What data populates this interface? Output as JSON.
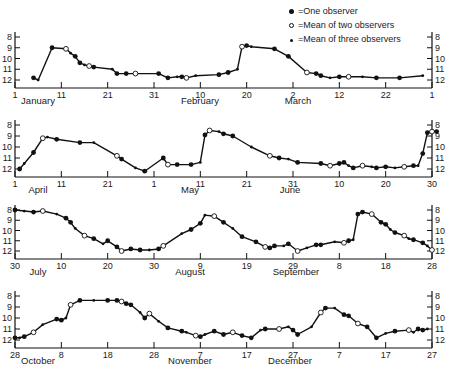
{
  "legend": {
    "one": "=One observer",
    "two": "=Mean of two observers",
    "three": "=Mean of three observers"
  },
  "chart_data": [
    {
      "type": "line",
      "title": "",
      "xlabel": "",
      "ylabel": "",
      "ylim": [
        12,
        8
      ],
      "yticks": [
        "8",
        "9",
        "10",
        "11",
        "12"
      ],
      "xticks": [
        "1",
        "11",
        "21",
        "31",
        "10",
        "20",
        "2",
        "12",
        "22",
        "1"
      ],
      "months": [
        "January",
        "February",
        "March"
      ],
      "x": [
        4,
        5,
        8,
        11,
        12,
        13,
        14,
        15,
        16,
        17,
        21,
        22,
        24,
        26,
        31,
        33,
        35,
        36,
        37,
        39,
        44,
        46,
        48,
        49,
        50,
        51,
        56,
        59,
        63,
        65,
        66,
        68,
        70,
        72,
        75,
        78,
        83,
        88
      ],
      "values": [
        11.8,
        12.0,
        9.0,
        9.1,
        9.5,
        9.8,
        10.4,
        10.6,
        10.7,
        10.8,
        11.0,
        11.4,
        11.4,
        11.4,
        11.4,
        11.8,
        11.7,
        11.7,
        11.8,
        11.6,
        11.5,
        11.3,
        11.0,
        8.9,
        8.8,
        8.9,
        9.1,
        9.8,
        11.3,
        11.4,
        11.6,
        11.8,
        11.7,
        11.7,
        11.7,
        11.8,
        11.8,
        11.6
      ]
    },
    {
      "type": "line",
      "ylim": [
        12,
        8
      ],
      "yticks": [
        "8",
        "9",
        "10",
        "11",
        "12"
      ],
      "xticks": [
        "1",
        "11",
        "21",
        "1",
        "11",
        "21",
        "31",
        "10",
        "20",
        "30"
      ],
      "months": [
        "April",
        "May",
        "June"
      ],
      "x": [
        1,
        2,
        4,
        6,
        7,
        9,
        14,
        17,
        22,
        23,
        26,
        28,
        32,
        33,
        35,
        38,
        40,
        41,
        42,
        44,
        45,
        47,
        51,
        55,
        57,
        59,
        61,
        66,
        68,
        70,
        71,
        72,
        73,
        75,
        77,
        78,
        80,
        82,
        84,
        86,
        87,
        88,
        89,
        90,
        91
      ],
      "values": [
        12.0,
        11.5,
        10.5,
        9.2,
        9.1,
        9.3,
        9.6,
        9.6,
        10.8,
        11.1,
        11.9,
        12.2,
        11.0,
        11.6,
        11.6,
        11.6,
        11.4,
        8.9,
        8.5,
        8.6,
        8.8,
        9.0,
        10.0,
        10.8,
        11.0,
        11.1,
        11.4,
        11.5,
        11.7,
        11.5,
        11.4,
        11.7,
        11.9,
        11.7,
        11.8,
        11.9,
        11.8,
        11.9,
        11.8,
        11.7,
        11.7,
        10.6,
        8.7,
        8.6,
        8.6
      ]
    },
    {
      "type": "line",
      "ylim": [
        12,
        8
      ],
      "yticks": [
        "8",
        "9",
        "10",
        "11",
        "12"
      ],
      "xticks": [
        "30",
        "10",
        "20",
        "30",
        "9",
        "19",
        "29",
        "8",
        "18",
        "28"
      ],
      "months": [
        "July",
        "August",
        "September"
      ],
      "x": [
        0,
        2,
        4,
        6,
        9,
        11,
        12,
        13,
        15,
        17,
        19,
        20,
        22,
        23,
        25,
        27,
        29,
        31,
        32,
        36,
        38,
        40,
        41,
        43,
        45,
        47,
        49,
        52,
        54,
        55,
        56,
        58,
        59,
        61,
        63,
        65,
        66,
        69,
        71,
        72,
        73,
        74,
        75,
        77,
        79,
        80,
        81,
        82,
        84,
        85,
        86,
        88,
        89,
        90
      ],
      "values": [
        8.0,
        8.1,
        8.2,
        8.1,
        8.4,
        8.8,
        9.2,
        9.8,
        10.5,
        10.8,
        11.3,
        11.0,
        11.6,
        12.0,
        11.8,
        11.9,
        11.9,
        11.8,
        11.5,
        10.3,
        9.9,
        9.3,
        8.5,
        8.6,
        9.2,
        9.8,
        10.6,
        11.1,
        11.6,
        11.7,
        11.5,
        11.5,
        11.3,
        12.0,
        11.7,
        11.4,
        11.4,
        11.1,
        11.2,
        11.0,
        10.9,
        8.4,
        8.2,
        8.4,
        9.2,
        9.4,
        9.9,
        10.2,
        10.5,
        10.8,
        10.9,
        11.2,
        11.5,
        11.9
      ]
    },
    {
      "type": "line",
      "ylim": [
        12,
        8
      ],
      "yticks": [
        "8",
        "9",
        "10",
        "11",
        "12"
      ],
      "xticks": [
        "28",
        "8",
        "18",
        "28",
        "7",
        "17",
        "27",
        "7",
        "17",
        "27"
      ],
      "months": [
        "October",
        "November",
        "December"
      ],
      "x": [
        0,
        1,
        2,
        4,
        6,
        9,
        10,
        11,
        12,
        14,
        17,
        20,
        22,
        23,
        24,
        25,
        27,
        28,
        29,
        31,
        33,
        36,
        37,
        39,
        40,
        41,
        43,
        45,
        47,
        49,
        51,
        53,
        54,
        57,
        59,
        60,
        61,
        64,
        66,
        67,
        69,
        71,
        72,
        74,
        76,
        78,
        80,
        82,
        85,
        86,
        87,
        88,
        89
      ],
      "values": [
        11.8,
        11.8,
        11.7,
        11.3,
        10.6,
        10.1,
        10.2,
        10.0,
        8.8,
        8.4,
        8.4,
        8.4,
        8.4,
        8.5,
        8.7,
        8.8,
        9.5,
        10.0,
        9.6,
        10.3,
        10.9,
        11.2,
        11.3,
        11.6,
        11.7,
        11.5,
        11.2,
        11.5,
        11.3,
        11.6,
        11.8,
        11.1,
        11.0,
        11.0,
        10.8,
        11.1,
        11.5,
        10.8,
        9.5,
        9.1,
        9.1,
        9.7,
        9.8,
        10.5,
        10.8,
        11.8,
        11.4,
        11.2,
        11.1,
        11.3,
        11.0,
        11.1,
        11.0
      ]
    }
  ]
}
